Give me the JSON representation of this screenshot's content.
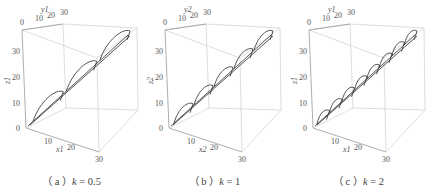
{
  "figure": {
    "panels": [
      {
        "id": "a",
        "caption_prefix": "（ a ）",
        "caption_k": "k",
        "caption_eq": " = 0.5",
        "x_label": "x",
        "x_sub": "1",
        "y_label": "y",
        "y_sub": "1",
        "z_label": "z",
        "z_sub": "1",
        "x_ticks": [
          "10",
          "20",
          "30"
        ],
        "y_ticks": [
          "0",
          "10",
          "20",
          "30"
        ],
        "z_ticks": [
          "0",
          "10",
          "20",
          "30"
        ],
        "loops": 3
      },
      {
        "id": "b",
        "caption_prefix": "（ b ）",
        "caption_k": "k",
        "caption_eq": " = 1",
        "x_label": "x",
        "x_sub": "2",
        "y_label": "y",
        "y_sub": "2",
        "z_label": "z",
        "z_sub": "2",
        "x_ticks": [
          "10",
          "20",
          "30"
        ],
        "y_ticks": [
          "0",
          "10",
          "20",
          "30"
        ],
        "z_ticks": [
          "0",
          "10",
          "20",
          "30"
        ],
        "loops": 5
      },
      {
        "id": "c",
        "caption_prefix": "（ c ）",
        "caption_k": "k",
        "caption_eq": " = 2",
        "x_label": "x",
        "x_sub": "1",
        "y_label": "y",
        "y_sub": "1",
        "z_label": "z",
        "z_sub": "1",
        "x_ticks": [
          "10",
          "20",
          "30"
        ],
        "y_ticks": [
          "0",
          "10",
          "20",
          "30"
        ],
        "z_ticks": [
          "0",
          "10",
          "20",
          "30"
        ],
        "loops": 8
      }
    ]
  },
  "chart_data": [
    {
      "type": "line",
      "title": "(a) k = 0.5",
      "dimensions": 3,
      "xlabel": "x1",
      "ylabel": "y1",
      "zlabel": "z1",
      "xlim": [
        0,
        30
      ],
      "ylim": [
        0,
        30
      ],
      "zlim": [
        0,
        35
      ],
      "description": "3D trajectory rising diagonally from origin to ~(30,30,33) with 3 loop/spike segments",
      "approx_points": [
        [
          0,
          0,
          0
        ],
        [
          10,
          10,
          11
        ],
        [
          20,
          20,
          22
        ],
        [
          30,
          30,
          33
        ]
      ]
    },
    {
      "type": "line",
      "title": "(b) k = 1",
      "dimensions": 3,
      "xlabel": "x2",
      "ylabel": "y2",
      "zlabel": "z2",
      "xlim": [
        0,
        30
      ],
      "ylim": [
        0,
        30
      ],
      "zlim": [
        0,
        35
      ],
      "description": "3D trajectory rising diagonally from origin to ~(30,30,33) with 5 loop/spike segments",
      "approx_points": [
        [
          0,
          0,
          0
        ],
        [
          6,
          6,
          7
        ],
        [
          12,
          12,
          13
        ],
        [
          18,
          18,
          20
        ],
        [
          24,
          24,
          26
        ],
        [
          30,
          30,
          33
        ]
      ]
    },
    {
      "type": "line",
      "title": "(c) k = 2",
      "dimensions": 3,
      "xlabel": "x1",
      "ylabel": "y1",
      "zlabel": "z1",
      "xlim": [
        0,
        30
      ],
      "ylim": [
        0,
        30
      ],
      "zlim": [
        0,
        35
      ],
      "description": "3D trajectory rising diagonally from origin to ~(30,30,33) with ~8 loop/spike segments",
      "approx_points": [
        [
          0,
          0,
          0
        ],
        [
          4,
          4,
          4
        ],
        [
          8,
          8,
          9
        ],
        [
          12,
          12,
          13
        ],
        [
          16,
          16,
          18
        ],
        [
          20,
          20,
          22
        ],
        [
          24,
          24,
          26
        ],
        [
          28,
          28,
          31
        ],
        [
          30,
          30,
          33
        ]
      ]
    }
  ]
}
